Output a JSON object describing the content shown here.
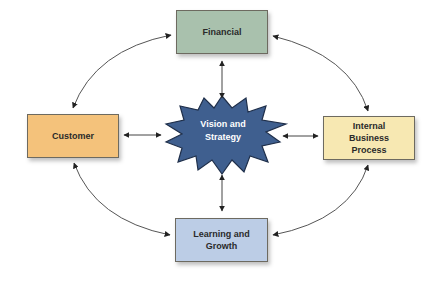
{
  "diagram": {
    "center": {
      "label_line1": "Vision and",
      "label_line2": "Strategy",
      "fill": "#3f5f8f",
      "stroke": "#1f2f4a"
    },
    "nodes": {
      "financial": {
        "label": "Financial",
        "fill": "#a9c1ad"
      },
      "customer": {
        "label": "Customer",
        "fill": "#f4c27b"
      },
      "internal": {
        "label_line1": "Internal",
        "label_line2": "Business",
        "label_line3": "Process",
        "fill": "#f7e8b2"
      },
      "learning": {
        "label_line1": "Learning and",
        "label_line2": "Growth",
        "fill": "#bccde6"
      }
    },
    "connections": [
      "Financial <-> Vision and Strategy",
      "Customer <-> Vision and Strategy",
      "Internal Business Process <-> Vision and Strategy",
      "Learning and Growth <-> Vision and Strategy",
      "Financial <-> Customer",
      "Financial <-> Internal Business Process",
      "Customer <-> Learning and Growth",
      "Internal Business Process <-> Learning and Growth"
    ]
  }
}
